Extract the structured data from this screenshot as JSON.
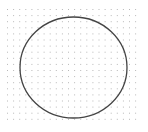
{
  "canvas": {
    "width": 148,
    "height": 132,
    "background": "#ffffff"
  },
  "grid": {
    "type": "dot-grid",
    "origin_x": 7,
    "origin_y": 9,
    "spacing": 6.1,
    "cols": 22,
    "rows": 19,
    "dot_color": "#b8b8b8",
    "dot_size": 1
  },
  "shape": {
    "type": "ellipse",
    "cx": 73.5,
    "cy": 67.5,
    "rx": 53.5,
    "ry": 50.5,
    "stroke": "#444444",
    "stroke_width": 1.3,
    "fill": "none"
  }
}
